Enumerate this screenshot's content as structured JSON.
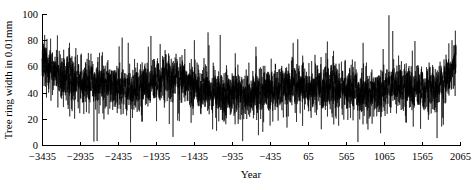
{
  "chart_data": {
    "type": "line",
    "title": "",
    "subtitle": "",
    "xlabel": "Year",
    "ylabel": "Tree ring width in 0.01mm",
    "xlim": [
      -3435,
      2065
    ],
    "ylim": [
      0,
      100
    ],
    "xticks": [
      -3435,
      -2935,
      -2435,
      -1935,
      -1435,
      -935,
      -435,
      65,
      565,
      1065,
      1565,
      2065
    ],
    "xtick_labels": [
      "−3435",
      "−2935",
      "−2435",
      "−1935",
      "−1435",
      "−935",
      "−435",
      "65",
      "565",
      "1065",
      "1565",
      "2065"
    ],
    "yticks": [
      0,
      20,
      40,
      60,
      80,
      100
    ],
    "ytick_labels": [
      "0",
      "20",
      "40",
      "60",
      "80",
      "100"
    ],
    "grid": false,
    "legend": null,
    "legend_position": "none",
    "series": [
      {
        "name": "Tree ring width",
        "color": "#000000",
        "x_start": -3435,
        "x_end": 2012,
        "x_step": 1,
        "units": "0.01mm",
        "description": "Annual tree ring width chronology, dense high-frequency noise about a slowly varying mean",
        "summary": {
          "mean": 45,
          "min": 0,
          "max": 100,
          "noise_amplitude": 14
        },
        "baseline_profile": [
          {
            "year": -3435,
            "value": 62
          },
          {
            "year": -3300,
            "value": 58
          },
          {
            "year": -3150,
            "value": 52
          },
          {
            "year": -3000,
            "value": 49
          },
          {
            "year": -2850,
            "value": 46
          },
          {
            "year": -2700,
            "value": 48
          },
          {
            "year": -2550,
            "value": 45
          },
          {
            "year": -2400,
            "value": 44
          },
          {
            "year": -2250,
            "value": 43
          },
          {
            "year": -2100,
            "value": 46
          },
          {
            "year": -1950,
            "value": 48
          },
          {
            "year": -1800,
            "value": 52
          },
          {
            "year": -1650,
            "value": 50
          },
          {
            "year": -1500,
            "value": 46
          },
          {
            "year": -1350,
            "value": 43
          },
          {
            "year": -1200,
            "value": 41
          },
          {
            "year": -1050,
            "value": 40
          },
          {
            "year": -900,
            "value": 38
          },
          {
            "year": -750,
            "value": 37
          },
          {
            "year": -600,
            "value": 39
          },
          {
            "year": -450,
            "value": 42
          },
          {
            "year": -300,
            "value": 44
          },
          {
            "year": -150,
            "value": 45
          },
          {
            "year": 0,
            "value": 44
          },
          {
            "year": 150,
            "value": 43
          },
          {
            "year": 300,
            "value": 45
          },
          {
            "year": 450,
            "value": 44
          },
          {
            "year": 600,
            "value": 42
          },
          {
            "year": 750,
            "value": 40
          },
          {
            "year": 900,
            "value": 38
          },
          {
            "year": 1050,
            "value": 42
          },
          {
            "year": 1200,
            "value": 47
          },
          {
            "year": 1350,
            "value": 45
          },
          {
            "year": 1500,
            "value": 43
          },
          {
            "year": 1650,
            "value": 42
          },
          {
            "year": 1800,
            "value": 44
          },
          {
            "year": 1900,
            "value": 50
          },
          {
            "year": 1980,
            "value": 58
          },
          {
            "year": 2012,
            "value": 70
          }
        ],
        "notable_peaks": [
          {
            "year": -3400,
            "value": 84
          },
          {
            "year": -3370,
            "value": 81
          },
          {
            "year": -2990,
            "value": 74
          },
          {
            "year": -2380,
            "value": 82
          },
          {
            "year": -2300,
            "value": 78
          },
          {
            "year": -1880,
            "value": 77
          },
          {
            "year": -1430,
            "value": 80
          },
          {
            "year": -1250,
            "value": 86
          },
          {
            "year": -1090,
            "value": 84
          },
          {
            "year": -620,
            "value": 75
          },
          {
            "year": -130,
            "value": 78
          },
          {
            "year": 320,
            "value": 79
          },
          {
            "year": 790,
            "value": 78
          },
          {
            "year": 1130,
            "value": 99
          },
          {
            "year": 1180,
            "value": 87
          },
          {
            "year": 1960,
            "value": 80
          }
        ],
        "notable_troughs": [
          {
            "year": -2710,
            "value": 3
          },
          {
            "year": -2270,
            "value": 2
          },
          {
            "year": -1760,
            "value": 16
          },
          {
            "year": -1190,
            "value": 12
          },
          {
            "year": -530,
            "value": 10
          },
          {
            "year": 240,
            "value": 12
          },
          {
            "year": 1020,
            "value": 9
          },
          {
            "year": 1450,
            "value": 14
          }
        ]
      }
    ]
  },
  "layout": {
    "plot_left": 42,
    "plot_right": 460,
    "plot_top": 14,
    "plot_bottom": 145
  }
}
